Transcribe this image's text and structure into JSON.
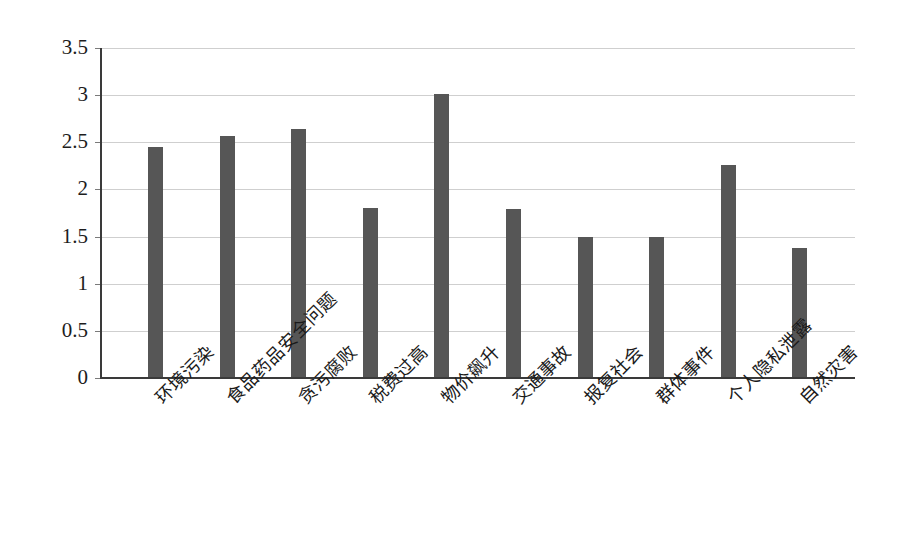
{
  "chart_data": {
    "type": "bar",
    "title": "",
    "subtitle": "",
    "xlabel": "",
    "ylabel": "",
    "categories": [
      "环境污染",
      "食品药品安全问题",
      "贪污腐败",
      "税费过高",
      "物价飙升",
      "交通事故",
      "报复社会",
      "群体事件",
      "个人隐私泄露",
      "自然灾害"
    ],
    "values": [
      2.44,
      2.56,
      2.63,
      1.79,
      3.0,
      1.78,
      1.49,
      1.49,
      2.25,
      1.37
    ],
    "ylim": [
      0,
      3.5
    ],
    "ytick_labels": [
      "0",
      "0.5",
      "1",
      "1.5",
      "2",
      "2.5",
      "3",
      "3.5"
    ],
    "ytick_values": [
      0,
      0.5,
      1,
      1.5,
      2,
      2.5,
      3,
      3.5
    ],
    "grid": true,
    "legend": false,
    "legend_position": "none",
    "bar_color": "#565656",
    "gridline_color": "#cfcfcf",
    "axis_color": "#3a3a3a"
  }
}
